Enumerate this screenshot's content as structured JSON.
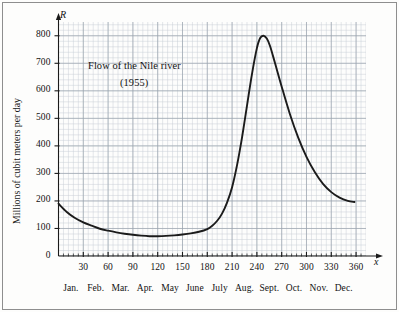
{
  "figure": {
    "width": 399,
    "height": 312,
    "background": "#fdfdfc",
    "frame_color": "#8e8e8e",
    "grid_minor_color": "#c9cfd6",
    "grid_major_color": "#9aa3ad",
    "curve_color": "#1b1b1b",
    "axis_color": "#1a1a1a"
  },
  "annotations": {
    "title_line1": "Flow of the Nile river",
    "title_line2": "(1955)",
    "y_axis_symbol": "R",
    "x_axis_symbol": "x",
    "y_axis_label": "Millions of cubit meters per day"
  },
  "chart_data": {
    "type": "line",
    "title": "Flow of the Nile river (1955)",
    "subtitle": "(1955)",
    "xlabel": "x",
    "ylabel": "Millions of cubit meters per day",
    "ylim": [
      0,
      850
    ],
    "xlim": [
      0,
      372
    ],
    "grid": true,
    "grid_minor_step_x": 6,
    "grid_minor_step_y": 20,
    "grid_major_step_x": 30,
    "grid_major_step_y": 100,
    "legend": null,
    "y_ticks": [
      0,
      100,
      200,
      300,
      400,
      500,
      600,
      700,
      800
    ],
    "y_tick_labels": [
      "0",
      "100",
      "200",
      "300",
      "400",
      "500",
      "600",
      "700",
      "800"
    ],
    "x_ticks": [
      30,
      60,
      90,
      120,
      150,
      180,
      210,
      240,
      270,
      300,
      330,
      360
    ],
    "x_tick_labels": [
      "30",
      "60",
      "90",
      "120",
      "150",
      "180",
      "210",
      "240",
      "270",
      "300",
      "330",
      "360"
    ],
    "x_minor_ticks": [
      6,
      12,
      18,
      24,
      36,
      42,
      48,
      54,
      66,
      72,
      78,
      84,
      96,
      102,
      108,
      114,
      126,
      132,
      138,
      144,
      156,
      162,
      168,
      174,
      186,
      192,
      198,
      204,
      216,
      222,
      228,
      234,
      246,
      252,
      258,
      264,
      276,
      282,
      288,
      294,
      306,
      312,
      318,
      324,
      336,
      342,
      348,
      354,
      366
    ],
    "month_labels": [
      "Jan.",
      "Feb.",
      "Mar.",
      "Apr.",
      "May",
      "June",
      "July",
      "Aug.",
      "Sept.",
      "Oct.",
      "Nov.",
      "Dec."
    ],
    "month_tick_centers": [
      15,
      45,
      75,
      105,
      135,
      165,
      195,
      225,
      255,
      285,
      315,
      345
    ],
    "series": [
      {
        "name": "Nile river flow 1955",
        "points": [
          [
            0,
            190
          ],
          [
            10,
            160
          ],
          [
            20,
            138
          ],
          [
            30,
            122
          ],
          [
            40,
            110
          ],
          [
            50,
            99
          ],
          [
            60,
            92
          ],
          [
            70,
            86
          ],
          [
            80,
            81
          ],
          [
            90,
            77
          ],
          [
            100,
            74
          ],
          [
            110,
            72
          ],
          [
            120,
            72
          ],
          [
            130,
            73
          ],
          [
            140,
            75
          ],
          [
            150,
            78
          ],
          [
            160,
            82
          ],
          [
            170,
            88
          ],
          [
            180,
            98
          ],
          [
            186,
            110
          ],
          [
            192,
            128
          ],
          [
            198,
            155
          ],
          [
            204,
            195
          ],
          [
            210,
            250
          ],
          [
            216,
            330
          ],
          [
            222,
            430
          ],
          [
            228,
            545
          ],
          [
            234,
            660
          ],
          [
            240,
            755
          ],
          [
            244,
            792
          ],
          [
            248,
            800
          ],
          [
            252,
            790
          ],
          [
            256,
            762
          ],
          [
            262,
            700
          ],
          [
            270,
            615
          ],
          [
            280,
            515
          ],
          [
            290,
            430
          ],
          [
            300,
            360
          ],
          [
            310,
            305
          ],
          [
            320,
            262
          ],
          [
            330,
            232
          ],
          [
            340,
            212
          ],
          [
            350,
            200
          ],
          [
            358,
            196
          ]
        ]
      }
    ]
  }
}
